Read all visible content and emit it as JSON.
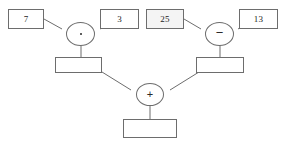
{
  "diagram": {
    "background_color": "#ffffff",
    "stroke_color": "#6d6d6d",
    "text_color": "#1d1d1d"
  },
  "operands": {
    "a": "7",
    "b": "3",
    "c": "25",
    "d": "13"
  },
  "operators": {
    "left": "·",
    "right": "−",
    "bottom": "+"
  },
  "results": {
    "left": "",
    "right": "",
    "final": ""
  }
}
